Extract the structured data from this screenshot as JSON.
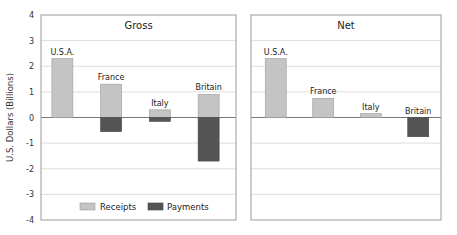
{
  "chart_data": {
    "type": "bar",
    "ylabel": "U.S. Dollars (Billions)",
    "ylim": [
      -4,
      4
    ],
    "yticks": [
      4,
      3,
      2,
      1,
      0,
      -1,
      -2,
      -3,
      -4
    ],
    "grid": true,
    "colors": {
      "receipts": "#c4c4c4",
      "payments": "#555555",
      "frame": "#9a9a9a",
      "grid": "#d6d6d6"
    },
    "legend": {
      "position": "bottom-center",
      "entries": [
        "Receipts",
        "Payments"
      ]
    },
    "panels": [
      {
        "title": "Gross",
        "categories": [
          "U.S.A.",
          "France",
          "Italy",
          "Britain"
        ],
        "series": [
          {
            "name": "Receipts",
            "values": [
              2.3,
              1.3,
              0.3,
              0.9
            ]
          },
          {
            "name": "Payments",
            "values": [
              0,
              -0.55,
              -0.15,
              -1.7
            ]
          }
        ]
      },
      {
        "title": "Net",
        "categories": [
          "U.S.A.",
          "France",
          "Italy",
          "Britain"
        ],
        "series": [
          {
            "name": "Net",
            "values": [
              2.3,
              0.75,
              0.15,
              -0.75
            ]
          }
        ]
      }
    ]
  }
}
